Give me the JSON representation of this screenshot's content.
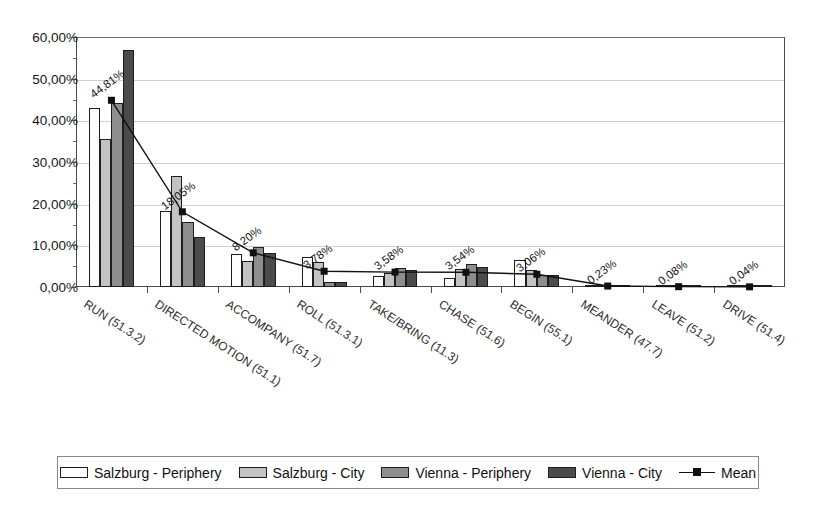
{
  "chart_data": {
    "type": "bar",
    "title": "",
    "subtitle": "",
    "xlabel": "",
    "ylabel": "",
    "ylim": [
      0,
      60
    ],
    "ytick_labels": [
      "0,00%",
      "10,00%",
      "20,00%",
      "30,00%",
      "40,00%",
      "50,00%",
      "60,00%"
    ],
    "ytick_values": [
      0,
      10,
      20,
      30,
      40,
      50,
      60
    ],
    "grid": true,
    "legend_position": "bottom",
    "categories": [
      "RUN (51.3.2)",
      "DIRECTED MOTION (51.1)",
      "ACCOMPANY (51.7)",
      "ROLL (51.3.1)",
      "TAKE/BRING (11.3)",
      "CHASE (51.6)",
      "BEGIN (55.1)",
      "MEANDER (47.7)",
      "LEAVE (51.2)",
      "DRIVE (51.4)"
    ],
    "series": [
      {
        "name": "Salzburg - Periphery",
        "color": "#fdfdfd",
        "values": [
          43.0,
          18.3,
          8.0,
          7.3,
          2.6,
          2.2,
          6.5,
          0.3,
          0.1,
          0.1
        ]
      },
      {
        "name": "Salzburg - City",
        "color": "#c3c3c3",
        "values": [
          35.6,
          26.7,
          6.3,
          6.0,
          3.4,
          4.3,
          4.2,
          0.4,
          0.1,
          0.1
        ]
      },
      {
        "name": "Vienna - Periphery",
        "color": "#8e8e8e",
        "values": [
          44.1,
          15.5,
          9.5,
          1.3,
          4.6,
          5.6,
          2.9,
          0.3,
          0.1,
          0.1
        ]
      },
      {
        "name": "Vienna - City",
        "color": "#4b4b4b",
        "values": [
          57.0,
          12.0,
          8.2,
          1.2,
          4.1,
          4.8,
          2.8,
          0.2,
          0.1,
          0.1
        ]
      }
    ],
    "mean_series": {
      "name": "Mean",
      "color": "#111111",
      "marker": "square",
      "values": [
        44.81,
        18.05,
        8.2,
        3.78,
        3.58,
        3.54,
        3.06,
        0.23,
        0.08,
        0.04
      ],
      "labels": [
        "44,81%",
        "18,05%",
        "8,20%",
        "3,78%",
        "3,58%",
        "3,54%",
        "3,06%",
        "0,23%",
        "0,08%",
        "0,04%"
      ]
    }
  },
  "legend": {
    "items": [
      {
        "label": "Salzburg - Periphery",
        "swatch": "#fdfdfd"
      },
      {
        "label": "Salzburg - City",
        "swatch": "#c3c3c3"
      },
      {
        "label": "Vienna - Periphery",
        "swatch": "#8e8e8e"
      },
      {
        "label": "Vienna - City",
        "swatch": "#4b4b4b"
      },
      {
        "label": "Mean",
        "swatch": "line-marker"
      }
    ]
  }
}
